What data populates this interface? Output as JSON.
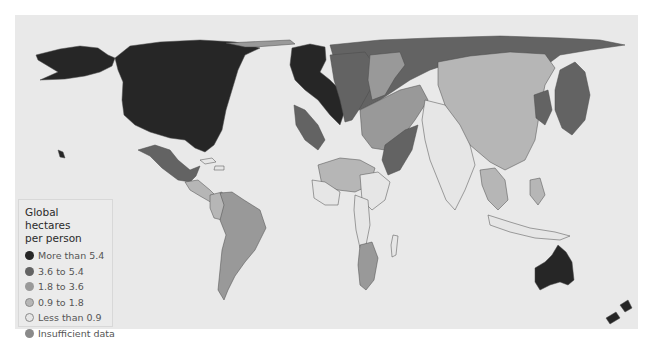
{
  "legend": {
    "title_line1": "Global hectares",
    "title_line2": "per person",
    "items": [
      {
        "label": "More than 5.4",
        "color": "#262626"
      },
      {
        "label": "3.6 to 5.4",
        "color": "#636363"
      },
      {
        "label": "1.8 to 3.6",
        "color": "#999999"
      },
      {
        "label": "0.9 to 1.8",
        "color": "#b6b6b6"
      },
      {
        "label": "Less than 0.9",
        "color": "#e6e6e6"
      },
      {
        "label": "Insufficient data",
        "color": "#8a8a8a"
      }
    ]
  },
  "map": {
    "background": "#e9e9e9",
    "subject": "Ecological footprint cartogram of the world"
  }
}
